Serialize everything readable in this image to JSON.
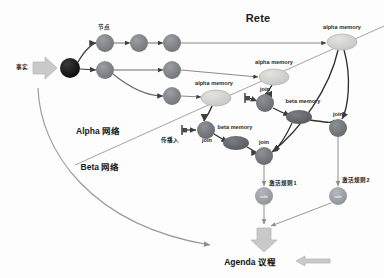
{
  "diagram": {
    "title": "Rete",
    "background": "#fdfdfd",
    "colors": {
      "alpha_node": "#7a7d82",
      "root_node": "#1a1a1a",
      "alpha_memory": "#d2d2cf",
      "join_node": "#6f7276",
      "beta_memory": "#5e6165",
      "rule_node": "#9a9da1",
      "edge": "#4a4a4a",
      "thin_edge": "#8d8d8d",
      "divider": "#9b9b9b",
      "big_arrow": "#c9c9c9",
      "text": "#1b1b1b"
    },
    "sections": [
      {
        "id": "alpha-network",
        "label": "Alpha 网络"
      },
      {
        "id": "beta-network",
        "label": "Beta 网络"
      }
    ],
    "input": {
      "label": "事实",
      "arrow_name": "facts-input-arrow"
    },
    "output": {
      "label": "Agenda 议程",
      "down_arrow_name": "agenda-down-arrow",
      "left_arrow_name": "agenda-feedback-arrow"
    },
    "labels": {
      "node": "节点",
      "propagate_in": "传播入",
      "alpha_memory": "alpha memory",
      "beta_memory": "beta memory",
      "join": "join",
      "rule": "rule",
      "activate_rule_1": "激活规则1",
      "activate_rule_2": "激活规则2"
    },
    "nodes": [
      {
        "id": "root",
        "kind": "root",
        "label": "",
        "x": 70,
        "y": 68,
        "r": 10
      },
      {
        "id": "a1",
        "kind": "alpha",
        "label": "节点",
        "x": 105,
        "y": 43,
        "r": 9
      },
      {
        "id": "a2",
        "kind": "alpha",
        "label": "",
        "x": 139,
        "y": 43,
        "r": 9
      },
      {
        "id": "a3",
        "kind": "alpha",
        "label": "",
        "x": 172,
        "y": 43,
        "r": 9
      },
      {
        "id": "b1",
        "kind": "alpha",
        "label": "",
        "x": 105,
        "y": 70,
        "r": 9
      },
      {
        "id": "b2",
        "kind": "alpha",
        "label": "",
        "x": 172,
        "y": 70,
        "r": 9
      },
      {
        "id": "c1",
        "kind": "alpha",
        "label": "",
        "x": 172,
        "y": 96,
        "r": 9
      },
      {
        "id": "am_top",
        "kind": "alpha-memory",
        "label": "alpha memory",
        "x": 342,
        "y": 42,
        "rx": 15,
        "ry": 8
      },
      {
        "id": "am_mid",
        "kind": "alpha-memory",
        "label": "alpha memory",
        "x": 274,
        "y": 77,
        "rx": 15,
        "ry": 8
      },
      {
        "id": "am_low",
        "kind": "alpha-memory",
        "label": "alpha memory",
        "x": 216,
        "y": 98,
        "rx": 15,
        "ry": 8
      },
      {
        "id": "join_a",
        "kind": "join",
        "label": "join",
        "x": 265,
        "y": 103,
        "r": 9
      },
      {
        "id": "bm_a",
        "kind": "beta-memory",
        "label": "beta memory",
        "x": 299,
        "y": 117,
        "rx": 13,
        "ry": 7
      },
      {
        "id": "join_b",
        "kind": "join",
        "label": "join",
        "x": 206,
        "y": 130,
        "r": 9
      },
      {
        "id": "bm_b",
        "kind": "beta-memory",
        "label": "beta memory",
        "x": 236,
        "y": 143,
        "rx": 13,
        "ry": 7
      },
      {
        "id": "join_c",
        "kind": "join",
        "label": "join",
        "x": 264,
        "y": 156,
        "r": 9
      },
      {
        "id": "join_d",
        "kind": "join",
        "label": "join",
        "x": 338,
        "y": 128,
        "r": 9
      },
      {
        "id": "rule_1",
        "kind": "rule",
        "label": "rule",
        "x": 264,
        "y": 196,
        "r": 9
      },
      {
        "id": "rule_2",
        "kind": "rule",
        "label": "rule",
        "x": 338,
        "y": 196,
        "r": 9
      }
    ],
    "terminals": [
      {
        "id": "t1",
        "x": 246,
        "y": 98,
        "name": "terminal-marker-1"
      },
      {
        "id": "t2",
        "x": 184,
        "y": 130,
        "name": "terminal-marker-2"
      }
    ]
  }
}
